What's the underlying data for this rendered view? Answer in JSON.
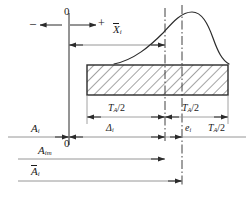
{
  "figure": {
    "type": "engineering-tolerance-diagram",
    "stroke_color": "#2b2b2b",
    "thin_color": "#8a8a8a",
    "hatch_color": "#4a4a4a",
    "background": "#ffffff"
  },
  "labels": {
    "zero_top": "0",
    "zero_bottom": "0",
    "minus_sign": "–",
    "plus_sign": "+",
    "x_bar_i": {
      "base": "X",
      "sub": "i",
      "overbar": true
    },
    "tolerance_left": {
      "base": "T",
      "sub": "A",
      "tail": "/2"
    },
    "tolerance_right": {
      "base": "T",
      "sub": "A",
      "tail": "/2"
    },
    "tolerance_far_right": {
      "base": "T",
      "sub": "A",
      "tail": "/2"
    },
    "delta_i": {
      "base": "Δ",
      "sub": "i"
    },
    "e_i": {
      "base": "e",
      "sub": "i"
    },
    "a_i": {
      "base": "A",
      "sub": "i",
      "overbar": false
    },
    "a_im": {
      "base": "A",
      "sub": "im",
      "overbar": false
    },
    "a_bar_i": {
      "base": "A",
      "sub": "i",
      "overbar": true
    }
  },
  "geometry": {
    "axis_x_zero": 69,
    "center_line_1_x": 165,
    "center_line_2_x": 182,
    "bar_left_x": 87,
    "bar_right_x": 228,
    "bar_top_y": 65,
    "bar_bottom_y": 95,
    "main_axis_y": 137,
    "a_im_axis_y": 159,
    "a_bar_axis_y": 181
  },
  "curve": {
    "description": "skewed probability density curve",
    "peak_x": 190,
    "peak_y": 12
  }
}
